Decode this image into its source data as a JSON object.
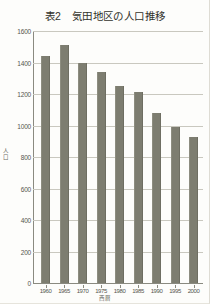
{
  "chart_data": {
    "type": "bar",
    "title": "表2　気田地区の人口推移",
    "xlabel": "西暦",
    "ylabel": "人口",
    "categories": [
      "1960",
      "1965",
      "1970",
      "1975",
      "1980",
      "1985",
      "1990",
      "1995",
      "2000"
    ],
    "values": [
      1440,
      1510,
      1400,
      1340,
      1250,
      1210,
      1080,
      990,
      925
    ],
    "ylim": [
      0,
      1600
    ],
    "ytick_labels": [
      "1600",
      "1400",
      "1200",
      "1000",
      "800",
      "600",
      "400",
      "200",
      "0"
    ],
    "ytick_values": [
      1600,
      1400,
      1200,
      1000,
      800,
      600,
      400,
      200,
      0
    ],
    "grid": true,
    "legend": "none",
    "bar_color": "#7d7d70",
    "grid_color": "#c9c8bf",
    "axis_color": "#8a8a80"
  }
}
